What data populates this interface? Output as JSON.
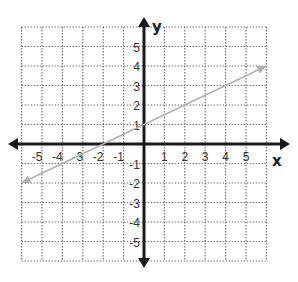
{
  "chart_data": {
    "type": "line",
    "title": "",
    "xlabel": "x",
    "ylabel": "y",
    "xlim": [
      -6,
      6
    ],
    "ylim": [
      -6,
      6
    ],
    "grid": true,
    "x_ticks": [
      "-5",
      "-4",
      "-3",
      "-2",
      "-1",
      "1",
      "2",
      "3",
      "4",
      "5"
    ],
    "y_ticks": [
      "5",
      "4",
      "3",
      "2",
      "1",
      "-1",
      "-2",
      "-3",
      "-4",
      "-5"
    ],
    "series": [
      {
        "name": "line",
        "equation": "y = 0.5x + 1",
        "x": [
          -6,
          6
        ],
        "y": [
          -2,
          4
        ],
        "color": "#b0b0b0",
        "arrows": "both"
      }
    ]
  },
  "colors": {
    "axis": "#1a1a1a",
    "grid": "#777777",
    "line": "#b0b0b0"
  }
}
